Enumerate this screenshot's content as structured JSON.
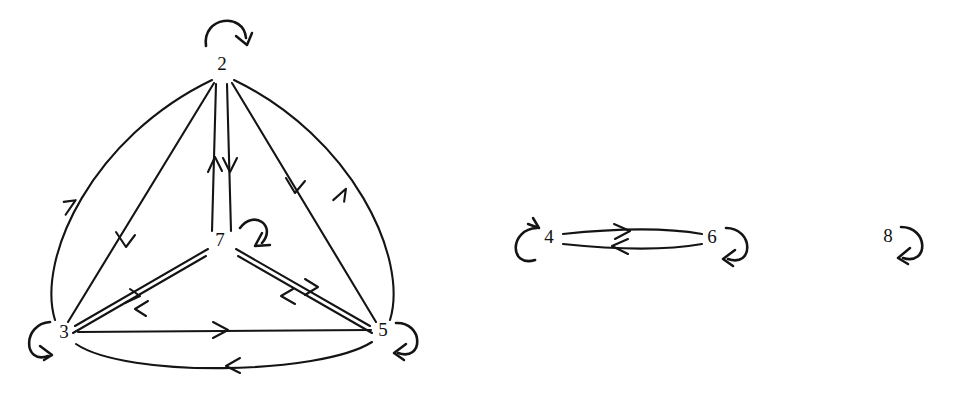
{
  "figure": {
    "kind": "hand-drawn-directed-graph",
    "background_color": "#ffffff",
    "ink_color": "#141414",
    "width": 953,
    "height": 395,
    "components": 3
  },
  "nodes": [
    {
      "id": "2",
      "label": "2",
      "x": 222,
      "y": 65,
      "component": 1
    },
    {
      "id": "7",
      "label": "7",
      "x": 222,
      "y": 241,
      "component": 1
    },
    {
      "id": "3",
      "label": "3",
      "x": 63,
      "y": 333,
      "component": 1
    },
    {
      "id": "5",
      "label": "5",
      "x": 382,
      "y": 333,
      "component": 1
    },
    {
      "id": "4",
      "label": "4",
      "x": 549,
      "y": 238,
      "component": 2
    },
    {
      "id": "6",
      "label": "6",
      "x": 712,
      "y": 238,
      "component": 2
    },
    {
      "id": "8",
      "label": "8",
      "x": 889,
      "y": 237,
      "component": 3
    }
  ],
  "self_loops": [
    {
      "node": "2",
      "placement": "top",
      "arrow_direction": "down-right"
    },
    {
      "node": "7",
      "placement": "upper-right",
      "arrow_direction": "down-left"
    },
    {
      "node": "3",
      "placement": "left",
      "arrow_direction": "up-right"
    },
    {
      "node": "5",
      "placement": "right",
      "arrow_direction": "left"
    },
    {
      "node": "4",
      "placement": "left",
      "arrow_direction": "up-right"
    },
    {
      "node": "6",
      "placement": "right",
      "arrow_direction": "left"
    },
    {
      "node": "8",
      "placement": "right",
      "arrow_direction": "left"
    }
  ],
  "edges": [
    {
      "from": "3",
      "to": "2",
      "style": "curve-outer-left",
      "label": "3 to 2"
    },
    {
      "from": "2",
      "to": "3",
      "style": "straight-inner",
      "label": "2 to 3"
    },
    {
      "from": "7",
      "to": "2",
      "style": "vertical-left",
      "label": "7 to 2"
    },
    {
      "from": "2",
      "to": "7",
      "style": "vertical-right",
      "label": "2 to 7"
    },
    {
      "from": "2",
      "to": "5",
      "style": "straight-inner",
      "label": "2 to 5"
    },
    {
      "from": "5",
      "to": "2",
      "style": "curve-outer-right",
      "label": "5 to 2"
    },
    {
      "from": "3",
      "to": "7",
      "style": "parallel-upper",
      "label": "3 to 7"
    },
    {
      "from": "7",
      "to": "3",
      "style": "parallel-lower",
      "label": "7 to 3"
    },
    {
      "from": "7",
      "to": "5",
      "style": "parallel-upper",
      "label": "7 to 5"
    },
    {
      "from": "5",
      "to": "7",
      "style": "parallel-lower",
      "label": "5 to 7"
    },
    {
      "from": "3",
      "to": "5",
      "style": "straight-horizontal",
      "label": "3 to 5"
    },
    {
      "from": "5",
      "to": "3",
      "style": "curve-below",
      "label": "5 to 3"
    },
    {
      "from": "4",
      "to": "6",
      "style": "lens-upper",
      "label": "4 to 6"
    },
    {
      "from": "6",
      "to": "4",
      "style": "lens-lower",
      "label": "6 to 4"
    }
  ],
  "counts": {
    "node_total": 7,
    "edge_total": 14,
    "self_loop_total": 7
  }
}
